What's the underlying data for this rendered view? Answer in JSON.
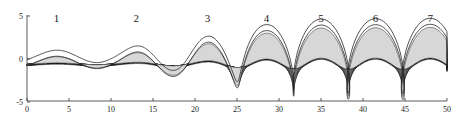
{
  "chart_data": {
    "type": "area",
    "title": "",
    "xlabel": "",
    "ylabel": "",
    "xlim": [
      0,
      50
    ],
    "ylim": [
      -5,
      5
    ],
    "x_ticks": [
      0,
      5,
      10,
      15,
      20,
      25,
      30,
      35,
      40,
      45,
      50
    ],
    "y_ticks": [
      -5,
      0,
      5
    ],
    "grid": false,
    "legend": null,
    "annotations": [
      {
        "text": "1",
        "x": 3.5
      },
      {
        "text": "2",
        "x": 13
      },
      {
        "text": "3",
        "x": 21.5
      },
      {
        "text": "4",
        "x": 28.5
      },
      {
        "text": "5",
        "x": 35
      },
      {
        "text": "6",
        "x": 41.5
      },
      {
        "text": "7",
        "x": 48
      }
    ],
    "crest_x": [
      3.5,
      13,
      21.5,
      28.5,
      35,
      41.5,
      48
    ],
    "outer_surface_amplitude": [
      {
        "x": 0,
        "a": 0.6
      },
      {
        "x": 10,
        "a": 0.8
      },
      {
        "x": 20,
        "a": 2.0
      },
      {
        "x": 28,
        "a": 3.6
      },
      {
        "x": 35,
        "a": 4.3
      },
      {
        "x": 50,
        "a": 4.4
      }
    ],
    "layers": 10
  }
}
